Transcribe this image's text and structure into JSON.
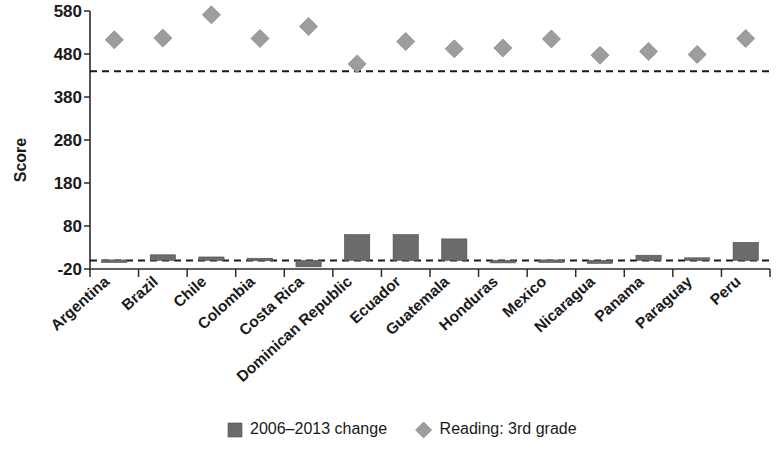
{
  "chart_data": {
    "type": "bar",
    "title": "",
    "subtitle": "",
    "xlabel": "",
    "ylabel": "Score",
    "ylim": [
      -20,
      580
    ],
    "yticks": [
      -20,
      80,
      180,
      280,
      380,
      480,
      580
    ],
    "ytick_labels": [
      "-20",
      "80",
      "180",
      "280",
      "380",
      "480",
      "580"
    ],
    "grid": false,
    "legend_position": "bottom",
    "categories": [
      "Argentina",
      "Brazil",
      "Chile",
      "Colombia",
      "Costa Rica",
      "Dominican Republic",
      "Ecuador",
      "Guatemala",
      "Honduras",
      "Mexico",
      "Nicaragua",
      "Panama",
      "Paraguay",
      "Peru"
    ],
    "series": [
      {
        "name": "2006–2013 change",
        "type": "bar",
        "color": "#6b6b6b",
        "values": [
          1,
          13,
          8,
          5,
          -15,
          60,
          60,
          50,
          0,
          1,
          -7,
          12,
          6,
          42
        ]
      },
      {
        "name": "Reading: 3rd grade",
        "type": "scatter",
        "marker": "diamond",
        "color": "#9d9d9d",
        "values": [
          513,
          517,
          571,
          516,
          544,
          457,
          509,
          492,
          494,
          515,
          477,
          486,
          479,
          516
        ]
      }
    ],
    "reference_lines": [
      {
        "value": 440,
        "style": "dashed",
        "label": ""
      },
      {
        "value": 0,
        "style": "dashed",
        "label": ""
      }
    ]
  },
  "legend": {
    "items": [
      {
        "label": "2006–2013 change",
        "marker": "square",
        "color": "#6b6b6b"
      },
      {
        "label": "Reading: 3rd grade",
        "marker": "diamond",
        "color": "#9d9d9d"
      }
    ]
  },
  "axes": {
    "y_title": "Score"
  }
}
